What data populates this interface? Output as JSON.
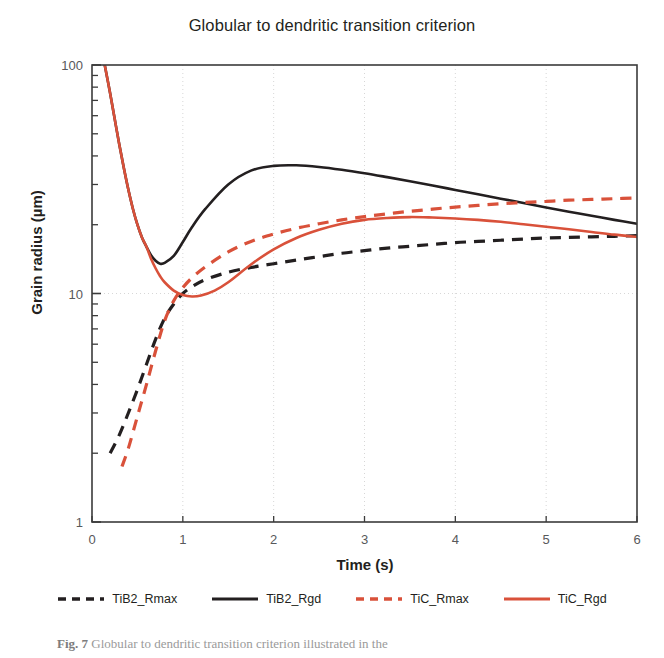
{
  "chart_data": {
    "type": "line",
    "title": "Globular to dendritic transition criterion",
    "xlabel": "Time (s)",
    "ylabel": "Grain radius (µm)",
    "xlim": [
      0,
      6
    ],
    "ylim": [
      1,
      100
    ],
    "yscale": "log",
    "xscale": "linear",
    "xticks": [
      "0",
      "1",
      "2",
      "3",
      "4",
      "5",
      "6"
    ],
    "xtick_values": [
      0,
      1,
      2,
      3,
      4,
      5,
      6
    ],
    "yticks": [
      "1",
      "10",
      "100"
    ],
    "ytick_values": [
      1,
      10,
      100
    ],
    "grid": "vertical dotted at x=1..5, horizontal dotted at y=10",
    "legend_position": "below-plot",
    "series": [
      {
        "name": "TiB2_Rmax",
        "color": "#231f20",
        "style": "dashed",
        "x": [
          0.2,
          0.3,
          0.4,
          0.5,
          0.6,
          0.7,
          0.8,
          0.9,
          1.0,
          1.1,
          1.25,
          1.5,
          1.75,
          2.0,
          2.25,
          2.5,
          2.75,
          3.0,
          3.25,
          3.5,
          3.75,
          4.0,
          4.25,
          4.5,
          4.75,
          5.0,
          5.25,
          5.5,
          5.75,
          6.0
        ],
        "y": [
          2.0,
          2.4,
          3.0,
          3.8,
          4.9,
          6.3,
          7.8,
          9.0,
          10.0,
          10.7,
          11.5,
          12.4,
          13.0,
          13.5,
          14.0,
          14.5,
          15.0,
          15.4,
          15.8,
          16.1,
          16.4,
          16.7,
          16.9,
          17.1,
          17.3,
          17.5,
          17.6,
          17.7,
          17.8,
          17.9
        ]
      },
      {
        "name": "TiB2_Rgd",
        "color": "#231f20",
        "style": "solid",
        "x": [
          0.14,
          0.2,
          0.25,
          0.3,
          0.35,
          0.4,
          0.45,
          0.5,
          0.55,
          0.6,
          0.65,
          0.7,
          0.75,
          0.8,
          0.9,
          1.0,
          1.1,
          1.25,
          1.5,
          1.75,
          2.0,
          2.25,
          2.5,
          2.75,
          3.0,
          3.25,
          3.5,
          3.75,
          4.0,
          4.25,
          4.5,
          4.75,
          5.0,
          5.25,
          5.5,
          5.75,
          6.0
        ],
        "y": [
          100.0,
          75.0,
          58.0,
          45.0,
          35.5,
          28.5,
          23.5,
          20.0,
          17.6,
          16.0,
          14.7,
          13.9,
          13.5,
          13.6,
          14.6,
          16.8,
          19.5,
          23.5,
          30.0,
          34.5,
          36.2,
          36.4,
          35.8,
          34.8,
          33.6,
          32.3,
          31.0,
          29.7,
          28.4,
          27.2,
          26.0,
          24.9,
          23.8,
          22.8,
          21.9,
          21.0,
          20.2
        ]
      },
      {
        "name": "TiC_Rmax",
        "color": "#d9513a",
        "style": "dashed",
        "x": [
          0.33,
          0.4,
          0.5,
          0.6,
          0.7,
          0.8,
          0.9,
          1.0,
          1.1,
          1.25,
          1.5,
          1.75,
          2.0,
          2.25,
          2.5,
          2.75,
          3.0,
          3.25,
          3.5,
          3.75,
          4.0,
          4.25,
          4.5,
          4.75,
          5.0,
          5.25,
          5.5,
          5.75,
          6.0
        ],
        "y": [
          1.75,
          2.1,
          2.9,
          4.0,
          5.6,
          7.6,
          9.3,
          10.6,
          11.7,
          13.1,
          15.2,
          16.9,
          18.2,
          19.3,
          20.2,
          21.0,
          21.7,
          22.3,
          22.9,
          23.4,
          23.9,
          24.3,
          24.7,
          25.0,
          25.3,
          25.6,
          25.8,
          26.0,
          26.2
        ]
      },
      {
        "name": "TiC_Rgd",
        "color": "#d9513a",
        "style": "solid",
        "x": [
          0.14,
          0.2,
          0.25,
          0.3,
          0.35,
          0.4,
          0.45,
          0.5,
          0.55,
          0.6,
          0.65,
          0.7,
          0.75,
          0.8,
          0.9,
          1.0,
          1.1,
          1.2,
          1.35,
          1.5,
          1.75,
          2.0,
          2.25,
          2.5,
          2.75,
          3.0,
          3.25,
          3.5,
          3.75,
          4.0,
          4.25,
          4.5,
          4.75,
          5.0,
          5.25,
          5.5,
          5.75,
          6.0
        ],
        "y": [
          100.0,
          75.0,
          58.0,
          45.0,
          35.5,
          28.5,
          23.5,
          20.0,
          17.6,
          16.0,
          14.2,
          12.9,
          11.9,
          11.2,
          10.3,
          9.85,
          9.7,
          9.8,
          10.3,
          11.2,
          13.4,
          15.6,
          17.5,
          19.0,
          20.2,
          21.0,
          21.4,
          21.6,
          21.5,
          21.3,
          21.0,
          20.6,
          20.1,
          19.6,
          19.1,
          18.6,
          18.1,
          17.7
        ]
      }
    ]
  },
  "legend": {
    "items": [
      {
        "label": "TiB2_Rmax",
        "color": "#231f20",
        "style": "dashed"
      },
      {
        "label": "TiB2_Rgd",
        "color": "#231f20",
        "style": "solid"
      },
      {
        "label": "TiC_Rmax",
        "color": "#d9513a",
        "style": "dashed"
      },
      {
        "label": "TiC_Rgd",
        "color": "#d9513a",
        "style": "solid"
      }
    ]
  },
  "caption": {
    "figure_number": "Fig. 7",
    "text": "Globular to dendritic transition criterion illustrated in the"
  }
}
